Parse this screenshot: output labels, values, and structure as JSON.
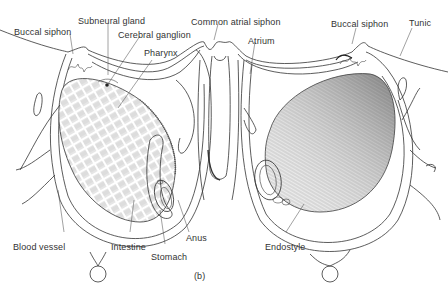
{
  "figure": {
    "panel_label": "(b)",
    "labels": {
      "buccal_siphon_left": "Buccal siphon",
      "subneural_gland": "Subneural gland",
      "cerebral_ganglion": "Cerebral ganglion",
      "pharynx": "Pharynx",
      "common_atrial_siphon": "Common atrial siphon",
      "atrium": "Atrium",
      "buccal_siphon_right": "Buccal siphon",
      "tunic": "Tunic",
      "blood_vessel": "Blood vessel",
      "intestine": "Intestine",
      "stomach": "Stomach",
      "anus": "Anus",
      "endostyle": "Endostyle"
    }
  }
}
